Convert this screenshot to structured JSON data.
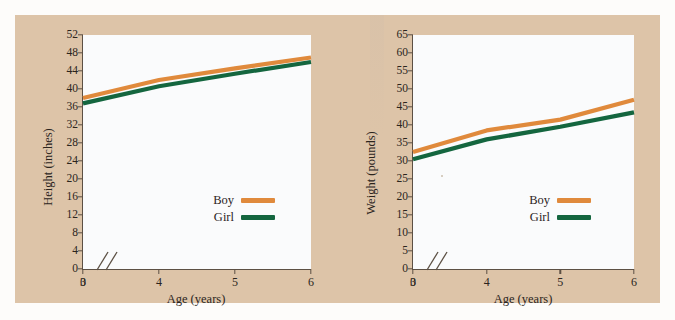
{
  "figure": {
    "background_color": "#ddc4a8",
    "page_color": "#fdfcfa",
    "series_colors": {
      "boy": "#E08A3C",
      "girl": "#14663F"
    },
    "axis_color": "#5c5044",
    "plot_background": "#fafbfc"
  },
  "charts": [
    {
      "id": "height",
      "chart_data": {
        "type": "line",
        "title": "",
        "xlabel": "Age (years)",
        "ylabel": "Height (inches)",
        "x": [
          3,
          4,
          5,
          6
        ],
        "xtick_labels": [
          "3",
          "4",
          "5",
          "6"
        ],
        "origin_label": "0",
        "xlim": [
          3,
          6
        ],
        "ylim": [
          0,
          52
        ],
        "ytick_labels": [
          "0",
          "4",
          "8",
          "12",
          "16",
          "20",
          "24",
          "28",
          "32",
          "36",
          "40",
          "44",
          "48",
          "52"
        ],
        "ytick_values": [
          0,
          4,
          8,
          12,
          16,
          20,
          24,
          28,
          32,
          36,
          40,
          44,
          48,
          52
        ],
        "grid": false,
        "axis_break": true,
        "legend_position": "inside-lower-right",
        "series": [
          {
            "name": "Boy",
            "color": "#E08A3C",
            "values": [
              38.0,
              42.0,
              44.6,
              47.0
            ]
          },
          {
            "name": "Girl",
            "color": "#14663F",
            "values": [
              36.8,
              40.6,
              43.4,
              46.0
            ]
          }
        ]
      }
    },
    {
      "id": "weight",
      "chart_data": {
        "type": "line",
        "title": "",
        "xlabel": "Age (years)",
        "ylabel": "Weight (pounds)",
        "x": [
          3,
          4,
          5,
          6
        ],
        "xtick_labels": [
          "3",
          "4",
          "5",
          "6"
        ],
        "origin_label": "0",
        "xlim": [
          3,
          6
        ],
        "ylim": [
          0,
          65
        ],
        "ytick_labels": [
          "0",
          "5",
          "10",
          "15",
          "20",
          "25",
          "30",
          "35",
          "40",
          "45",
          "50",
          "55",
          "60",
          "65"
        ],
        "ytick_values": [
          0,
          5,
          10,
          15,
          20,
          25,
          30,
          35,
          40,
          45,
          50,
          55,
          60,
          65
        ],
        "grid": false,
        "axis_break": true,
        "legend_position": "inside-lower-right",
        "series": [
          {
            "name": "Boy",
            "color": "#E08A3C",
            "values": [
              32.5,
              38.5,
              41.5,
              47.0
            ]
          },
          {
            "name": "Girl",
            "color": "#14663F",
            "values": [
              30.5,
              36.0,
              39.5,
              43.5
            ]
          }
        ]
      }
    }
  ]
}
